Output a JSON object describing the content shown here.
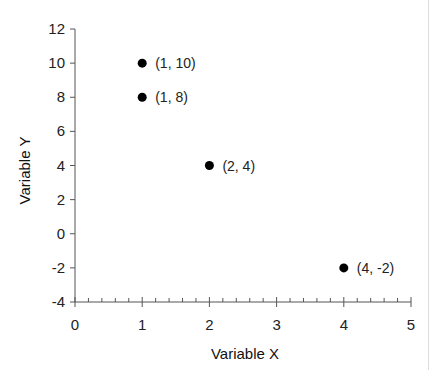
{
  "chart_data": {
    "type": "scatter",
    "title": "",
    "xlabel": "Variable X",
    "ylabel": "Variable Y",
    "xlim": [
      0,
      5
    ],
    "ylim": [
      -4,
      12
    ],
    "x_ticks": [
      0,
      1,
      2,
      3,
      4,
      5
    ],
    "y_ticks": [
      -4,
      -2,
      0,
      2,
      4,
      6,
      8,
      10,
      12
    ],
    "x_minor_ticks_per_major": 5,
    "grid": false,
    "legend": null,
    "series": [
      {
        "name": "points",
        "color": "#000000",
        "points": [
          {
            "x": 1,
            "y": 10,
            "label": "(1, 10)"
          },
          {
            "x": 1,
            "y": 8,
            "label": "(1, 8)"
          },
          {
            "x": 2,
            "y": 4,
            "label": "(2, 4)"
          },
          {
            "x": 4,
            "y": -2,
            "label": "(4, -2)"
          }
        ]
      }
    ]
  },
  "layout": {
    "plot_left": 75,
    "plot_right": 411,
    "plot_top": 29,
    "plot_bottom": 302,
    "axis_color": "#555555"
  }
}
